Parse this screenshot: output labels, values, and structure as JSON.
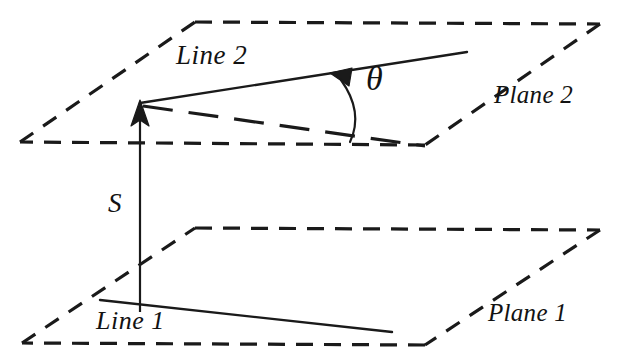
{
  "figure": {
    "type": "geometry-diagram",
    "background_color": "#ffffff",
    "stroke_color": "#1a1a1a",
    "labels": {
      "line2": "Line 2",
      "plane2": "Plane 2",
      "theta": "θ",
      "spacing": "S",
      "line1": "Line 1",
      "plane1": "Plane 1"
    },
    "geometry": {
      "plane2": {
        "name": "Plane 2",
        "style": "dashed",
        "corners": [
          [
            195,
            22
          ],
          [
            600,
            24
          ],
          [
            425,
            145
          ],
          [
            20,
            142
          ]
        ]
      },
      "plane1": {
        "name": "Plane 1",
        "style": "dashed",
        "corners": [
          [
            195,
            228
          ],
          [
            600,
            230
          ],
          [
            425,
            345
          ],
          [
            22,
            343
          ]
        ]
      },
      "line2": {
        "name": "Line 2",
        "style": "solid",
        "from": [
          140,
          103
        ],
        "to": [
          467,
          52
        ],
        "arrow_at": [
          338,
          72
        ],
        "arrow_direction": "toward-vertex"
      },
      "line1": {
        "name": "Line 1",
        "style": "solid",
        "from": [
          100,
          300
        ],
        "to": [
          392,
          332
        ]
      },
      "projection_line": {
        "name": "projection of Line 1 onto Plane 2",
        "style": "dashed",
        "from": [
          140,
          103
        ],
        "to": [
          425,
          146
        ]
      },
      "spacing_line": {
        "name": "S",
        "style": "solid",
        "from": [
          140,
          310
        ],
        "to": [
          140,
          103
        ],
        "arrow_head": "top"
      },
      "angle_arc": {
        "name": "theta",
        "vertex_ray_a": [
          338,
          72
        ],
        "vertex_ray_b": [
          349,
          140
        ],
        "label": "θ"
      }
    }
  }
}
